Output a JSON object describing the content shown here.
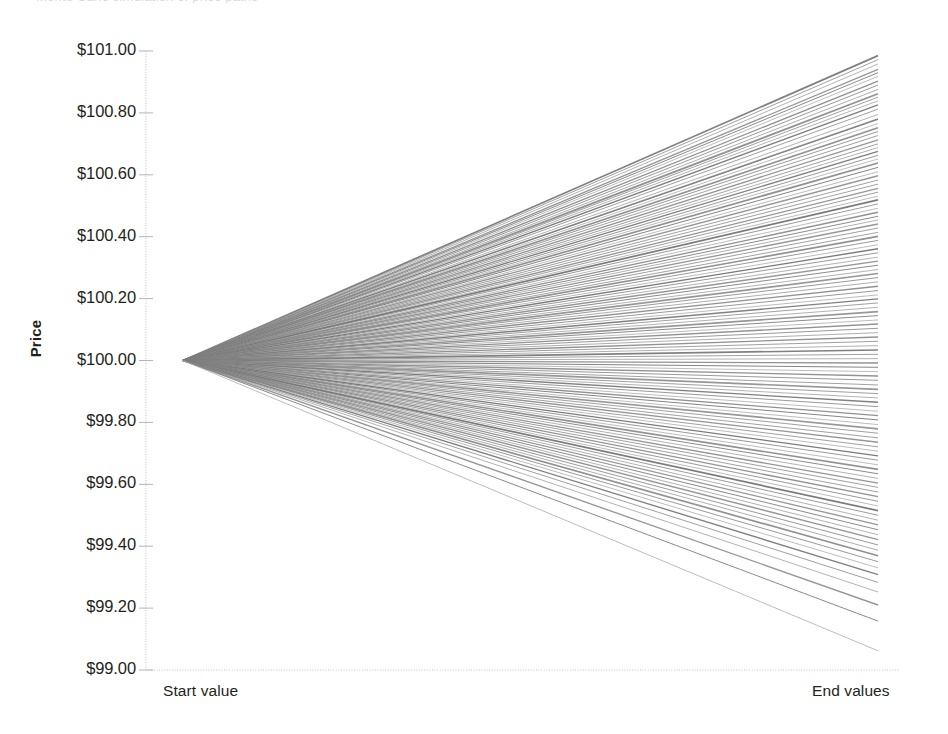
{
  "chart_data": {
    "type": "line",
    "title": "",
    "title_remnant": "Monte Carlo simulation of price paths",
    "xlabel": "",
    "ylabel": "Price",
    "x_tick_labels": [
      "Start value",
      "End values"
    ],
    "y_tick_labels": [
      "$101.00",
      "$100.80",
      "$100.60",
      "$100.40",
      "$100.20",
      "$100.00",
      "$99.80",
      "$99.60",
      "$99.40",
      "$99.20",
      "$99.00"
    ],
    "y_tick_values": [
      101.0,
      100.8,
      100.6,
      100.4,
      100.2,
      100.0,
      99.8,
      99.6,
      99.4,
      99.2,
      99.0
    ],
    "ylim": [
      99.0,
      101.0
    ],
    "xlim": [
      0,
      1
    ],
    "grid": false,
    "legend": false,
    "legend_position": "none",
    "series_count": 120,
    "start_value": 100.0,
    "line_color_family": "grayscale",
    "end_values": [
      100.985,
      100.972,
      100.958,
      100.941,
      100.93,
      100.918,
      100.903,
      100.89,
      100.876,
      100.862,
      100.851,
      100.839,
      100.826,
      100.812,
      100.795,
      100.781,
      100.779,
      100.766,
      100.752,
      100.74,
      100.727,
      100.713,
      100.7,
      100.688,
      100.676,
      100.663,
      100.651,
      100.638,
      100.624,
      100.61,
      100.597,
      100.583,
      100.57,
      100.556,
      100.544,
      100.531,
      100.519,
      100.506,
      100.492,
      100.479,
      100.466,
      100.454,
      100.441,
      100.428,
      100.414,
      100.401,
      100.388,
      100.374,
      100.361,
      100.348,
      100.334,
      100.321,
      100.308,
      100.294,
      100.281,
      100.268,
      100.254,
      100.24,
      100.226,
      100.212,
      100.199,
      100.186,
      100.172,
      100.158,
      100.145,
      100.131,
      100.118,
      100.104,
      100.09,
      100.076,
      100.062,
      100.048,
      100.034,
      100.02,
      100.006,
      99.992,
      99.978,
      99.964,
      99.95,
      99.936,
      99.921,
      99.907,
      99.893,
      99.879,
      99.865,
      99.851,
      99.836,
      99.822,
      99.808,
      99.793,
      99.779,
      99.765,
      99.75,
      99.736,
      99.721,
      99.707,
      99.692,
      99.678,
      99.663,
      99.648,
      99.634,
      99.619,
      99.604,
      99.59,
      99.575,
      99.56,
      99.545,
      99.53,
      99.515,
      99.5,
      99.484,
      99.469,
      99.453,
      99.437,
      99.421,
      99.404,
      99.387,
      99.369,
      99.35,
      99.33,
      99.308,
      99.283,
      99.252,
      99.21,
      99.158,
      99.062
    ],
    "line_shades": [
      "#7a7a7a",
      "#b4b4b4",
      "#9a9a9a",
      "#c8c8c8",
      "#555555",
      "#ababab",
      "#8e8e8e",
      "#d2d2d2",
      "#6a6a6a",
      "#bebebe",
      "#868686",
      "#e0e0e0",
      "#4f4f4f",
      "#a2a2a2",
      "#cfcfcf",
      "#747474",
      "#929292",
      "#dcdcdc",
      "#606060",
      "#b8b8b8",
      "#9e9e9e",
      "#c2c2c2",
      "#5a5a5a",
      "#a6a6a6",
      "#d6d6d6",
      "#7e7e7e",
      "#8a8a8a",
      "#e4e4e4",
      "#656565",
      "#bbbbbb"
    ]
  },
  "axes": {
    "y_axis_name": "price-axis",
    "x_axis_name": "category-axis",
    "spine_color": "#b0b0b0",
    "tick_color": "#9a9a9a"
  }
}
